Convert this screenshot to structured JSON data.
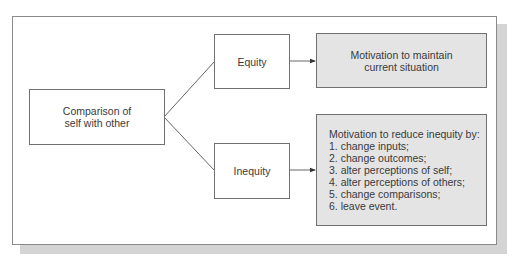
{
  "diagram": {
    "source_node": {
      "label_line1": "Comparison of",
      "label_line2": "self with other"
    },
    "branches": [
      {
        "label": "Equity",
        "outcome": {
          "line1": "Motivation to maintain",
          "line2": "current situation"
        }
      },
      {
        "label": "Inequity",
        "outcome": {
          "heading": "Motivation to reduce inequity by:",
          "items": [
            "1. change inputs;",
            "2. change outcomes;",
            "3. alter perceptions of self;",
            "4. alter perceptions of others;",
            "5. change comparisons;",
            "6. leave event."
          ]
        }
      }
    ],
    "colors": {
      "outcome_fill": "#e4e4e4",
      "border": "#707070",
      "shadow": "#d4d4d4"
    }
  }
}
